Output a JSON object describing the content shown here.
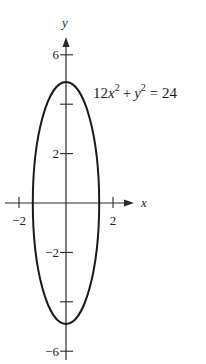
{
  "chart_data": {
    "type": "line",
    "title": "",
    "equation": {
      "coef": "12",
      "var1": "x",
      "exp1": "2",
      "plus": "+",
      "var2": "y",
      "exp2": "2",
      "eq": "= 24",
      "full": "12x^2 + y^2 = 24"
    },
    "xlabel": "x",
    "ylabel": "y",
    "xlim": [
      -2.6,
      2.9
    ],
    "ylim": [
      -6.4,
      6.9
    ],
    "x_ticks": [
      -2,
      2
    ],
    "x_tick_labels": [
      "−2",
      "2"
    ],
    "y_ticks": [
      6,
      4,
      2,
      -2,
      -4,
      -6
    ],
    "y_tick_labels": [
      "6",
      "",
      "2",
      "−2",
      "",
      "−6"
    ],
    "grid": false,
    "legend": null,
    "series": [
      {
        "name": "ellipse 12x^2 + y^2 = 24",
        "shape": "ellipse",
        "center": [
          0,
          0
        ],
        "semi_axis_x": 1.414,
        "semi_axis_y": 4.899,
        "points": [
          {
            "x": 0,
            "y": 4.899
          },
          {
            "x": 1.414,
            "y": 0
          },
          {
            "x": 0,
            "y": -4.899
          },
          {
            "x": -1.414,
            "y": 0
          }
        ]
      }
    ],
    "colors": {
      "curve": "#1a1a1a",
      "axes": "#2a2a2a",
      "background": "#ffffff"
    }
  },
  "layout": {
    "origin_px": [
      66,
      203
    ],
    "px_per_unit_x": 23.5,
    "px_per_unit_y": 24.7
  }
}
